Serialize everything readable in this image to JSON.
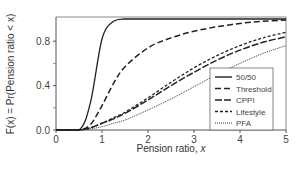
{
  "chart_data": {
    "type": "line",
    "title": "",
    "xlabel": "Pension ratio, x",
    "ylabel": "F(x) = Pr(Pension ratio < x)",
    "xlim": [
      0,
      5
    ],
    "ylim": [
      0,
      1
    ],
    "xticks": [
      "0",
      "1",
      "2",
      "3",
      "4",
      "5"
    ],
    "yticks": [
      "0.0",
      "0.4",
      "0.8"
    ],
    "yticks_minor": [
      0.2,
      0.6
    ],
    "grid": false,
    "legend_position": "lower right",
    "x": [
      0.5,
      0.75,
      1.0,
      1.25,
      1.5,
      2.0,
      2.5,
      3.0,
      3.5,
      4.0,
      4.5,
      5.0
    ],
    "series": [
      {
        "name": "50/50",
        "style": "solid",
        "values": [
          0.0,
          0.25,
          0.82,
          0.98,
          1.0,
          1.0,
          1.0,
          1.0,
          1.0,
          1.0,
          1.0,
          1.0
        ]
      },
      {
        "name": "Threshold",
        "style": "long-dash",
        "values": [
          0.0,
          0.05,
          0.22,
          0.42,
          0.57,
          0.74,
          0.83,
          0.89,
          0.93,
          0.96,
          0.98,
          0.99
        ]
      },
      {
        "name": "CPPI",
        "style": "dash",
        "values": [
          0.0,
          0.02,
          0.06,
          0.1,
          0.15,
          0.27,
          0.4,
          0.52,
          0.63,
          0.72,
          0.79,
          0.84
        ]
      },
      {
        "name": "Lifestyle",
        "style": "short-dash",
        "values": [
          0.0,
          0.02,
          0.06,
          0.11,
          0.16,
          0.29,
          0.43,
          0.56,
          0.67,
          0.76,
          0.83,
          0.88
        ]
      },
      {
        "name": "PFA",
        "style": "dotted",
        "values": [
          0.0,
          0.01,
          0.03,
          0.06,
          0.09,
          0.18,
          0.28,
          0.39,
          0.5,
          0.6,
          0.69,
          0.76
        ]
      }
    ]
  },
  "legend": {
    "items": [
      {
        "label": "50/50",
        "dash": ""
      },
      {
        "label": "Threshold",
        "dash": "6,3"
      },
      {
        "label": "CPPI",
        "dash": "7,2"
      },
      {
        "label": "Lifestyle",
        "dash": "3,2"
      },
      {
        "label": "PFA",
        "dash": "1,1"
      }
    ]
  },
  "colors": {
    "line": "#222222",
    "axis": "#555555",
    "text": "#444444"
  }
}
